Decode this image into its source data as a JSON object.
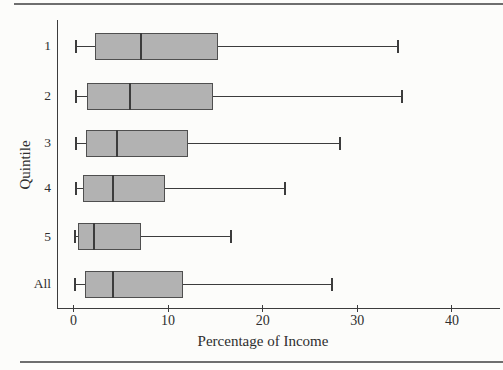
{
  "figure": {
    "background": "#fcfcfa",
    "rule_color": "#6e6e6e",
    "text_color": "#2e2e2e"
  },
  "chart_data": {
    "type": "boxplot",
    "orientation": "horizontal",
    "title": "",
    "xlabel": "Percentage of Income",
    "ylabel": "Quintile",
    "xlim": [
      0,
      45
    ],
    "xticks": [
      0,
      10,
      20,
      30,
      40
    ],
    "grid": false,
    "categories": [
      "1",
      "2",
      "3",
      "4",
      "5",
      "All"
    ],
    "series": [
      {
        "category": "1",
        "whisker_low": 0.3,
        "q1": 2.3,
        "median": 7.1,
        "q3": 15.3,
        "whisker_high": 34.3
      },
      {
        "category": "2",
        "whisker_low": 0.3,
        "q1": 1.4,
        "median": 6.0,
        "q3": 14.7,
        "whisker_high": 34.7
      },
      {
        "category": "3",
        "whisker_low": 0.3,
        "q1": 1.3,
        "median": 4.6,
        "q3": 12.1,
        "whisker_high": 28.2
      },
      {
        "category": "4",
        "whisker_low": 0.3,
        "q1": 1.0,
        "median": 4.2,
        "q3": 9.7,
        "whisker_high": 22.4
      },
      {
        "category": "5",
        "whisker_low": 0.2,
        "q1": 0.5,
        "median": 2.2,
        "q3": 7.1,
        "whisker_high": 16.6
      },
      {
        "category": "All",
        "whisker_low": 0.2,
        "q1": 1.2,
        "median": 4.2,
        "q3": 11.6,
        "whisker_high": 27.3
      }
    ],
    "colors": {
      "box_fill": "#b2b2b2",
      "box_border": "#4f4f4f",
      "line": "#3c3c3c"
    }
  }
}
